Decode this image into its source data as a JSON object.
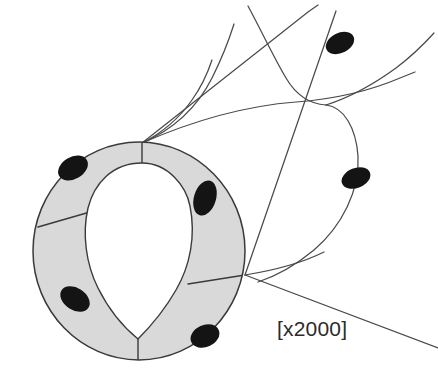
{
  "figure": {
    "magnification_label": "[x2000]",
    "colors": {
      "background": "#ffffff",
      "cell_cytoplasm_fill": "#d9d9d9",
      "cell_outline": "#3a3a3a",
      "nucleus_fill": "#141414",
      "surface_line": "#4a4a4a",
      "label_text": "#2b2b2b"
    },
    "view": {
      "type": "perspective-cutaway",
      "description": "Open end of a tube at lower-left showing wall cross-section, body of tube receding to upper-right"
    },
    "cross_section": {
      "name": "tube-wall-ring",
      "center_x": 139,
      "center_y": 251,
      "outer_radius_x": 106,
      "outer_radius_y": 109,
      "wall_thickness": 21,
      "cell_count": 6,
      "nucleus_count": 4,
      "junction_points": [
        {
          "name": "junction-top",
          "x": 142,
          "y": 143
        },
        {
          "name": "junction-left",
          "x": 38,
          "y": 227
        },
        {
          "name": "junction-bottom-left",
          "x": 138,
          "y": 360
        },
        {
          "name": "junction-bottom-right",
          "x": 245,
          "y": 275
        }
      ],
      "nuclei": [
        {
          "name": "nucleus-upper-left",
          "x": 73,
          "y": 168,
          "rx": 15,
          "ry": 11,
          "rotation": -28
        },
        {
          "name": "nucleus-right",
          "x": 205,
          "y": 197,
          "rx": 11,
          "ry": 17,
          "rotation": 18
        },
        {
          "name": "nucleus-lower-left",
          "x": 75,
          "y": 299,
          "rx": 15,
          "ry": 11,
          "rotation": 30
        },
        {
          "name": "nucleus-bottom-right",
          "x": 205,
          "y": 335,
          "rx": 14,
          "ry": 11,
          "rotation": -22
        }
      ]
    },
    "surface_cells": {
      "name": "tube-surface-cell-boundaries",
      "description": "Curved boundary lines of squamous cells on the outer tube surface receding to upper right",
      "line_count": 7,
      "free_nuclei": [
        {
          "name": "surface-nucleus-upper",
          "x": 340,
          "y": 42,
          "rx": 14,
          "ry": 9,
          "rotation": -25
        },
        {
          "name": "surface-nucleus-middle",
          "x": 356,
          "y": 178,
          "rx": 14,
          "ry": 9,
          "rotation": -20
        }
      ]
    }
  }
}
